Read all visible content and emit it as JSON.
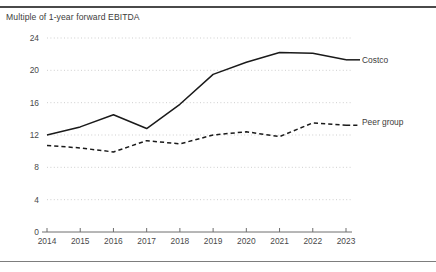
{
  "chart_title": "Multiple of 1-year forward EBITDA",
  "colors": {
    "line": "#1a1a1a",
    "grid": "#c9c9c9",
    "axis": "#6e6e6e",
    "rule": "#4a4a4a",
    "text": "#3d3d3d",
    "background": "#ffffff"
  },
  "labels": {
    "costco": "Costco",
    "peer_group": "Peer group"
  },
  "chart_data": {
    "type": "line",
    "title": "Multiple of 1-year forward EBITDA",
    "subtitle": "",
    "xlabel": "",
    "ylabel": "",
    "x": [
      2014,
      2015,
      2016,
      2017,
      2018,
      2019,
      2020,
      2021,
      2022,
      2023
    ],
    "categories": [
      "2014",
      "2015",
      "2016",
      "2017",
      "2018",
      "2019",
      "2020",
      "2021",
      "2022",
      "2023"
    ],
    "xtick_labels": [
      "2014",
      "2015",
      "2016",
      "2017",
      "2018",
      "2019",
      "2020",
      "2021",
      "2022",
      "2023"
    ],
    "ytick_labels": [
      "0",
      "4",
      "8",
      "12",
      "16",
      "20",
      "24"
    ],
    "yticks": [
      0,
      4,
      8,
      12,
      16,
      20,
      24
    ],
    "ylim": [
      0,
      24
    ],
    "xlim": [
      2014,
      2023
    ],
    "grid": "horizontal-dotted",
    "legend": "inline-right-end-of-line",
    "series": [
      {
        "name": "Costco",
        "style": "solid",
        "color": "#1a1a1a",
        "values": [
          12.0,
          13.0,
          14.5,
          12.8,
          15.8,
          19.5,
          21.0,
          22.2,
          22.1,
          21.3
        ]
      },
      {
        "name": "Peer group",
        "style": "dashed",
        "color": "#1a1a1a",
        "values": [
          10.7,
          10.4,
          9.9,
          11.3,
          10.9,
          12.0,
          12.4,
          11.8,
          13.5,
          13.2
        ]
      }
    ]
  }
}
